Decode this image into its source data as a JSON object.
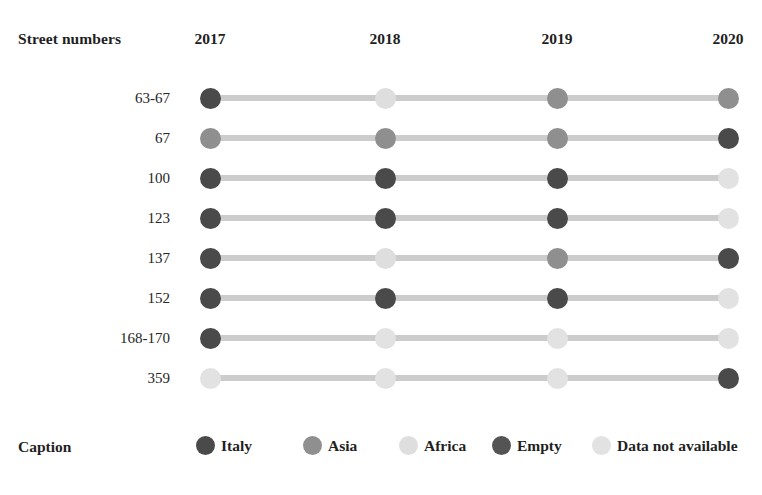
{
  "chart_data": {
    "type": "table",
    "title": "",
    "xlabel": "",
    "ylabel": "Street numbers",
    "grid": false,
    "legend_position": "bottom",
    "row_header": "Street numbers",
    "categories": [
      "2017",
      "2018",
      "2019",
      "2020"
    ],
    "row_labels": [
      "63-67",
      "67",
      "100",
      "123",
      "137",
      "152",
      "168-170",
      "359"
    ],
    "legend_title": "Caption",
    "legend": [
      {
        "label": "Italy",
        "color": "#4a4a4a"
      },
      {
        "label": "Asia",
        "color": "#8f8f8f"
      },
      {
        "label": "Africa",
        "color": "#dedede"
      },
      {
        "label": "Empty",
        "color": "#545454"
      },
      {
        "label": "Data not available",
        "color": "#e2e2e2"
      }
    ],
    "series": [
      {
        "name": "63-67",
        "values": [
          "Italy",
          "Africa",
          "Asia",
          "Asia"
        ]
      },
      {
        "name": "67",
        "values": [
          "Asia",
          "Asia",
          "Asia",
          "Italy"
        ]
      },
      {
        "name": "100",
        "values": [
          "Italy",
          "Italy",
          "Italy",
          "Data not available"
        ]
      },
      {
        "name": "123",
        "values": [
          "Italy",
          "Italy",
          "Italy",
          "Data not available"
        ]
      },
      {
        "name": "137",
        "values": [
          "Italy",
          "Africa",
          "Asia",
          "Italy"
        ]
      },
      {
        "name": "152",
        "values": [
          "Italy",
          "Italy",
          "Italy",
          "Data not available"
        ]
      },
      {
        "name": "168-170",
        "values": [
          "Italy",
          "Data not available",
          "Data not available",
          "Data not available"
        ]
      },
      {
        "name": "359",
        "values": [
          "Data not available",
          "Data not available",
          "Data not available",
          "Italy"
        ]
      }
    ],
    "connector_color": "#cccccc"
  },
  "footnote": {
    "text": ""
  }
}
